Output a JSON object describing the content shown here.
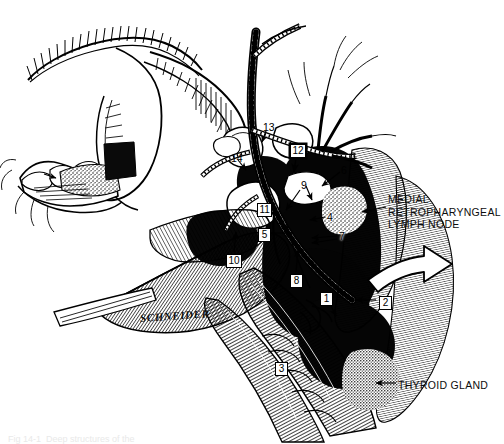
{
  "figure": {
    "domain": "anatomical-line-illustration",
    "title_caption": "Fig 14-1  Deep structures of the",
    "signature": "SCHNEIDER",
    "background_color": "#ffffff",
    "ink_color": "#000000"
  },
  "text_labels": [
    {
      "id": "medial-retropharyngeal-lymph-node",
      "lines": [
        "MEDIAL",
        "RETROPHARYNGEAL",
        "LYMPH NODE"
      ],
      "text": "MEDIAL\nRETROPHARYNGEAL\nLYMPH NODE",
      "x": 388,
      "y": 193,
      "align": "left"
    },
    {
      "id": "thyroid-gland",
      "lines": [
        "THYROID GLAND"
      ],
      "text": "THYROID GLAND",
      "x": 398,
      "y": 379,
      "align": "left"
    }
  ],
  "numbered_labels": [
    {
      "n": "1",
      "style": "box",
      "x": 320,
      "y": 292
    },
    {
      "n": "2",
      "style": "box",
      "x": 379,
      "y": 296
    },
    {
      "n": "3",
      "style": "box",
      "x": 275,
      "y": 362
    },
    {
      "n": "4",
      "style": "plain",
      "x": 327,
      "y": 211
    },
    {
      "n": "5",
      "style": "box",
      "x": 258,
      "y": 228
    },
    {
      "n": "6",
      "style": "plain",
      "x": 341,
      "y": 164
    },
    {
      "n": "7",
      "style": "plain",
      "x": 339,
      "y": 230
    },
    {
      "n": "8",
      "style": "box",
      "x": 290,
      "y": 274
    },
    {
      "n": "9",
      "style": "plain",
      "x": 301,
      "y": 179
    },
    {
      "n": "10",
      "style": "box",
      "x": 226,
      "y": 254
    },
    {
      "n": "11",
      "style": "box",
      "x": 257,
      "y": 203
    },
    {
      "n": "12",
      "style": "inverted",
      "x": 290,
      "y": 144
    },
    {
      "n": "13",
      "style": "plain",
      "x": 263,
      "y": 121
    },
    {
      "n": "14",
      "style": "plain",
      "x": 231,
      "y": 152
    }
  ]
}
